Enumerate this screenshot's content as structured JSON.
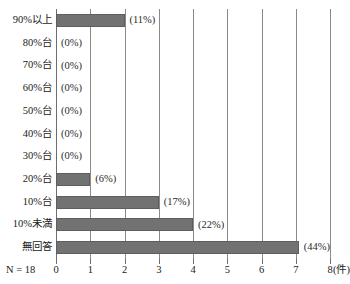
{
  "chart_data": {
    "type": "bar",
    "orientation": "horizontal",
    "title": "",
    "xlabel": "(件)",
    "ylabel": "",
    "xlim": [
      0,
      8
    ],
    "xticks": [
      0,
      1,
      2,
      3,
      4,
      5,
      6,
      7,
      8
    ],
    "xtick_labels": [
      "0",
      "1",
      "2",
      "3",
      "4",
      "5",
      "6",
      "7",
      "8"
    ],
    "grid": true,
    "legend": "none",
    "sample_size_note": "N = 18",
    "unit": "(件)",
    "bar_color": "#727272",
    "categories": [
      "90%以上",
      "80%台",
      "70%台",
      "60%台",
      "50%台",
      "40%台",
      "30%台",
      "20%台",
      "10%台",
      "10%未満",
      "無回答"
    ],
    "values": [
      2,
      0,
      0,
      0,
      0,
      0,
      0,
      1,
      3,
      4,
      8
    ],
    "data_labels": [
      "(11%)",
      "(0%)",
      "(0%)",
      "(0%)",
      "(0%)",
      "(0%)",
      "(0%)",
      "(6%)",
      "(17%)",
      "(22%)",
      "(44%)"
    ],
    "percentages": [
      11,
      0,
      0,
      0,
      0,
      0,
      0,
      6,
      17,
      22,
      44
    ]
  }
}
